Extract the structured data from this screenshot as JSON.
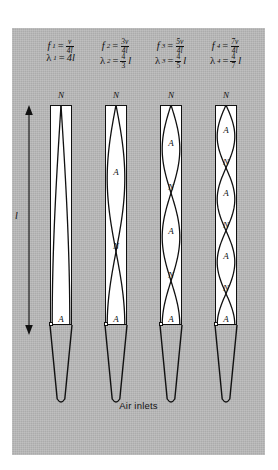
{
  "page_header": {
    "left": "",
    "right": ""
  },
  "figure": {
    "caption": "Air inlets",
    "length_label": "l",
    "background_color": "#b9b9b9",
    "pipe_fill_color": "#ffffff",
    "line_color": "#111111",
    "columns": [
      {
        "harmonic": 1,
        "frequency": {
          "symbol": "f",
          "index": "1",
          "equals": "=",
          "numerator": "v",
          "denominator": "4l"
        },
        "wavelength": {
          "symbol": "λ",
          "index": "1",
          "equals": "=",
          "value": "4l",
          "numerator": "",
          "denominator": ""
        },
        "labels": [
          "N",
          "A"
        ],
        "quarter_waves": 1
      },
      {
        "harmonic": 3,
        "frequency": {
          "symbol": "f",
          "index": "2",
          "equals": "=",
          "numerator": "3v",
          "denominator": "4l"
        },
        "wavelength": {
          "symbol": "λ",
          "index": "2",
          "equals": "=",
          "value": "",
          "numerator": "4",
          "denominator": "3",
          "suffix": "l"
        },
        "labels": [
          "N",
          "A",
          "N",
          "A"
        ],
        "quarter_waves": 3
      },
      {
        "harmonic": 5,
        "frequency": {
          "symbol": "f",
          "index": "3",
          "equals": "=",
          "numerator": "5v",
          "denominator": "4l"
        },
        "wavelength": {
          "symbol": "λ",
          "index": "3",
          "equals": "=",
          "value": "",
          "numerator": "4",
          "denominator": "5",
          "suffix": "l"
        },
        "labels": [
          "N",
          "A",
          "N",
          "A",
          "N",
          "A"
        ],
        "quarter_waves": 5
      },
      {
        "harmonic": 7,
        "frequency": {
          "symbol": "f",
          "index": "4",
          "equals": "=",
          "numerator": "7v",
          "denominator": "4l"
        },
        "wavelength": {
          "symbol": "λ",
          "index": "4",
          "equals": "=",
          "value": "",
          "numerator": "4",
          "denominator": "7",
          "suffix": "l"
        },
        "labels": [
          "N",
          "A",
          "N",
          "A",
          "N",
          "A",
          "N",
          "A"
        ],
        "quarter_waves": 7
      }
    ]
  },
  "chart_data": {
    "type": "diagram",
    "pipe_length_symbol": "l",
    "modes": [
      {
        "n": 1,
        "frequency": "v/4l",
        "wavelength": "4l",
        "nodes": 1,
        "antinodes": 1
      },
      {
        "n": 2,
        "frequency": "3v/4l",
        "wavelength": "(4/3)l",
        "nodes": 2,
        "antinodes": 2
      },
      {
        "n": 3,
        "frequency": "5v/4l",
        "wavelength": "(4/5)l",
        "nodes": 3,
        "antinodes": 3
      },
      {
        "n": 4,
        "frequency": "7v/4l",
        "wavelength": "(4/7)l",
        "nodes": 4,
        "antinodes": 4
      }
    ]
  }
}
